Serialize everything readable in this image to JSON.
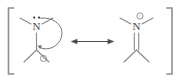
{
  "figure": {
    "kind": "chemical-resonance-diagram",
    "width": 185,
    "height": 82,
    "background_color": "#ffffff",
    "bond_color": "#8a8a8a",
    "atom_label_color": "#4a4a4a",
    "bracket_color": "#8f8f8f",
    "arrow_color": "#4a4a4a",
    "curved_arrow_color": "#6e6e6e",
    "charge_color": "#6a6a6a"
  },
  "brackets": {
    "left_symbol": "[",
    "right_symbol": "]"
  },
  "structures": [
    {
      "id": "left",
      "name": "neutral-amine-carbocation",
      "atom_label": "N",
      "lone_pair": {
        "present": true,
        "dot_count": 2,
        "position": "above-nitrogen"
      },
      "nitrogen_charge": "",
      "carbon_charge": "+",
      "carbon_charge_circled": true,
      "n_c_bond_order": 1,
      "methyl_count_on_n": 2,
      "methyl_count_on_c": 2,
      "curved_arrow": {
        "present": true,
        "from": "nitrogen-lone-pair",
        "to": "nitrogen-carbon-bond",
        "direction": "clockwise"
      }
    },
    {
      "id": "right",
      "name": "iminium-cation",
      "atom_label": "N",
      "lone_pair": {
        "present": false,
        "dot_count": 0,
        "position": ""
      },
      "nitrogen_charge": "+",
      "nitrogen_charge_circled": true,
      "carbon_charge": "",
      "n_c_bond_order": 2,
      "methyl_count_on_n": 2,
      "methyl_count_on_c": 2,
      "curved_arrow": {
        "present": false,
        "from": "",
        "to": "",
        "direction": ""
      }
    }
  ],
  "resonance_arrow": {
    "glyph": "<->",
    "double_headed": true,
    "orientation": "horizontal"
  }
}
